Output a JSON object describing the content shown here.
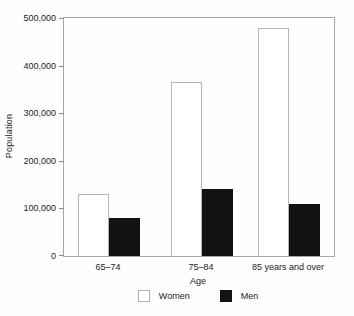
{
  "chart_data": {
    "type": "bar",
    "categories": [
      "65–74",
      "75–84",
      "85 years and over"
    ],
    "series": [
      {
        "name": "Women",
        "values": [
          130000,
          365000,
          480000
        ],
        "fill": "#ffffff",
        "border": "#b4b4b4"
      },
      {
        "name": "Men",
        "values": [
          80000,
          140000,
          110000
        ],
        "fill": "#121212",
        "border": "#121212"
      }
    ],
    "title": "",
    "xlabel": "Age",
    "ylabel": "Population",
    "ylim": [
      0,
      500000
    ],
    "ytick_step": 100000,
    "ytick_labels": [
      "0",
      "100,000",
      "200,000",
      "300,000",
      "400,000",
      "500,000"
    ],
    "grid": false,
    "frame": "full-box",
    "axis_color": "#a6a6a6",
    "legend_position": "bottom-center"
  }
}
